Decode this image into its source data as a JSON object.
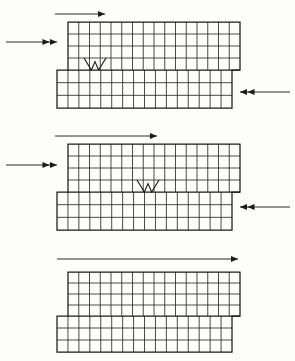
{
  "figure": {
    "background_color": "#fdfdfb",
    "line_color": "#2b2b2b",
    "outline_color": "#1a1a1a",
    "panel_count": 3
  },
  "geometry": {
    "upper_block": {
      "x": 68,
      "width": 172,
      "columns": 16,
      "rows": 4,
      "cell_width": 10.75,
      "cell_height": 12
    },
    "lower_block": {
      "x": 57,
      "width": 175,
      "columns": 16,
      "rows": 3,
      "cell_width": 10.9375,
      "cell_height": 12.67
    }
  },
  "panels": [
    {
      "id": "panel-1",
      "label": "Stage 1",
      "top_y": 22,
      "step_y": 70,
      "bottom_y": 108,
      "upper_x": 68,
      "upper_right": 240,
      "lower_x": 57,
      "lower_right": 232,
      "upper_rows": 4,
      "lower_rows": 3,
      "columns": 16,
      "crack": {
        "present": true,
        "shape": "W",
        "x_center": 95,
        "top_y": 58,
        "bottom_y": 70,
        "half_width": 11,
        "row_index": 3
      },
      "arrows": [
        {
          "name": "top-load-arrow",
          "direction": "right",
          "heads": 1,
          "x1": 55,
          "x2": 105,
          "y": 14
        },
        {
          "name": "left-load-arrow",
          "direction": "right",
          "heads": 2,
          "x1": 6,
          "x2": 57,
          "y": 42
        },
        {
          "name": "right-reaction-arrow",
          "direction": "left",
          "heads": 2,
          "x1": 290,
          "x2": 240,
          "y": 92
        }
      ]
    },
    {
      "id": "panel-2",
      "label": "Stage 2",
      "top_y": 144,
      "step_y": 192,
      "bottom_y": 230,
      "upper_x": 68,
      "upper_right": 240,
      "lower_x": 57,
      "lower_right": 232,
      "upper_rows": 4,
      "lower_rows": 3,
      "columns": 16,
      "crack": {
        "present": true,
        "shape": "W",
        "x_center": 148,
        "top_y": 180,
        "bottom_y": 192,
        "half_width": 11,
        "row_index": 3
      },
      "arrows": [
        {
          "name": "top-load-arrow",
          "direction": "right",
          "heads": 1,
          "x1": 55,
          "x2": 157,
          "y": 136
        },
        {
          "name": "left-load-arrow",
          "direction": "right",
          "heads": 2,
          "x1": 6,
          "x2": 57,
          "y": 165
        },
        {
          "name": "right-reaction-arrow",
          "direction": "left",
          "heads": 2,
          "x1": 290,
          "x2": 240,
          "y": 207
        }
      ]
    },
    {
      "id": "panel-3",
      "label": "Stage 3",
      "top_y": 272,
      "step_y": 316,
      "bottom_y": 352,
      "upper_x": 68,
      "upper_right": 240,
      "lower_x": 57,
      "lower_right": 232,
      "upper_rows": 4,
      "lower_rows": 3,
      "columns": 16,
      "crack": {
        "present": false
      },
      "arrows": [
        {
          "name": "top-load-arrow",
          "direction": "right",
          "heads": 1,
          "x1": 57,
          "x2": 238,
          "y": 259
        }
      ]
    }
  ]
}
